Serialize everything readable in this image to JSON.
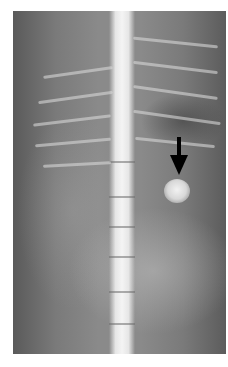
{
  "image": {
    "type": "radiograph",
    "description": "Ventrodorsal abdominal/thoracic X-ray with spine centered and a black arrow pointing to a radiopaque round mass on the right side",
    "colors": {
      "background": "#ffffff",
      "film_dark": "#5a5a5a",
      "bone": "#f0f0f0",
      "arrow": "#000000"
    }
  },
  "annotations": [
    {
      "type": "arrow",
      "direction": "down",
      "color": "#000000",
      "target": "radiopaque-lesion"
    }
  ]
}
